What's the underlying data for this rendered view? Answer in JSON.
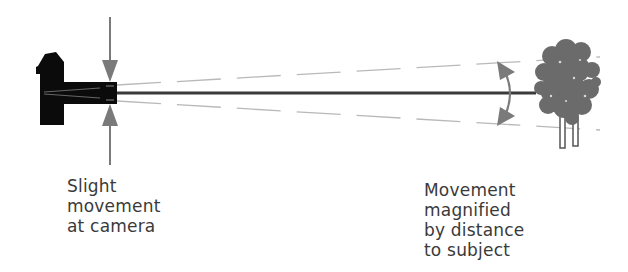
{
  "diagram": {
    "colors": {
      "camera": "#0b0b0b",
      "axis_line": "#3c3c3c",
      "arrow": "#7a7a7a",
      "dashed": "#b5b5b5",
      "tree": "#6e6e6e",
      "text": "#3a3a3a"
    },
    "nodes": [
      {
        "id": "camera",
        "label": "Camera"
      },
      {
        "id": "tree",
        "label": "Subject (tree)"
      }
    ],
    "captions": {
      "left": {
        "lines": [
          "Slight",
          "movement",
          "at camera"
        ]
      },
      "right": {
        "lines": [
          "Movement",
          "magnified",
          "by distance",
          "to subject"
        ]
      }
    }
  }
}
